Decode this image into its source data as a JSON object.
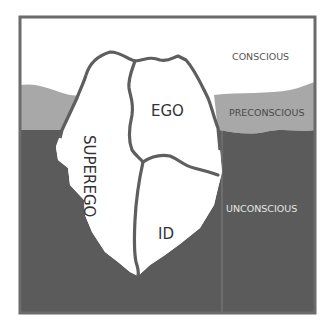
{
  "diagram": {
    "levels": [
      {
        "id": "conscious",
        "label": "CONSCIOUS",
        "color": "#ffffff"
      },
      {
        "id": "preconscious",
        "label": "PRECONSCIOUS",
        "color": "#a6a6a6"
      },
      {
        "id": "unconscious",
        "label": "UNCONSCIOUS",
        "color": "#595959"
      }
    ],
    "parts": [
      {
        "id": "superego",
        "label": "SUPEREGO"
      },
      {
        "id": "ego",
        "label": "EGO"
      },
      {
        "id": "id",
        "label": "ID"
      }
    ],
    "colors": {
      "frame": "#6b6b6b",
      "outline": "#5e5e5e",
      "iceberg_fill": "#ffffff"
    }
  }
}
